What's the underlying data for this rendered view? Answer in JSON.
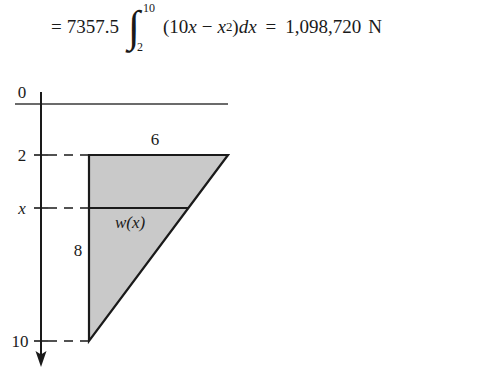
{
  "equation": {
    "lhs_equals": "=",
    "coefficient": "7357.5",
    "integral_lower": "2",
    "integral_upper": "10",
    "integrand_open": "(10",
    "integrand_var1": "x",
    "integrand_minus": "−",
    "integrand_var2": "x",
    "integrand_exponent": "2",
    "integrand_close": ")",
    "differential_d": "d",
    "differential_var": "x",
    "rhs_equals": "=",
    "result_value": "1,098,720",
    "result_unit": "N",
    "integral_symbol": "∫"
  },
  "diagram": {
    "type": "geometry",
    "axis": {
      "orientation": "vertical-down",
      "arrow": "down",
      "ticks": [
        {
          "label": "0",
          "depth": 0,
          "italic": false
        },
        {
          "label": "2",
          "depth": 2,
          "italic": false
        },
        {
          "label": "x",
          "depth": 5,
          "italic": true
        },
        {
          "label": "10",
          "depth": 10,
          "italic": false
        }
      ]
    },
    "surface_line_label": "0",
    "shape": {
      "name": "right-triangle-plate",
      "fill_color": "#c9c9c9",
      "stroke_color": "#1a1a1a",
      "top_width_label": "6",
      "left_height_label": "8",
      "strip_label": "w(x)"
    },
    "dashed_guides": [
      {
        "for_tick": "2"
      },
      {
        "for_tick": "x"
      },
      {
        "for_tick": "10"
      }
    ]
  },
  "colors": {
    "ink": "#1a1a1a",
    "shape_fill": "#c9c9c9",
    "surface_rule": "#3a3a3a",
    "page_background": "#ffffff"
  }
}
